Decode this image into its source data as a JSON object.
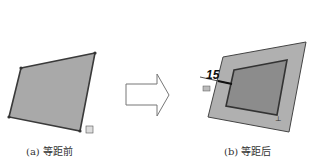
{
  "captions": {
    "left": "(a) 等距前",
    "right": "(b) 等距后"
  },
  "dimension": {
    "value": "15"
  },
  "colors": {
    "fill": "#a9a9a9",
    "inner_fill": "#8c8c8c",
    "edge": "#3a3a3a"
  }
}
